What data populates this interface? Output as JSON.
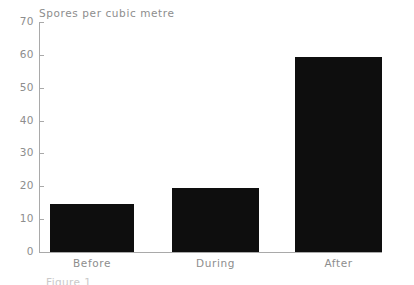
{
  "figure": {
    "axis_title": "Spores per cubic metre",
    "caption": "Figure 1",
    "background_color": "#ffffff",
    "axis_color": "#a9a9a9",
    "text_color": "#8d8d8d",
    "bar_color": "#0e0e0e"
  },
  "chart_data": {
    "type": "bar",
    "title": "",
    "subtitle": "",
    "xlabel": "",
    "ylabel": "Spores per cubic metre",
    "categories": [
      "Before",
      "During",
      "After"
    ],
    "values": [
      14.7,
      19.5,
      59.3
    ],
    "series": [
      {
        "name": "Spores per cubic metre",
        "values": [
          14.7,
          19.5,
          59.3
        ]
      }
    ],
    "ylim": [
      0,
      70
    ],
    "ytick_labels": [
      "0",
      "10",
      "20",
      "30",
      "40",
      "50",
      "60",
      "70"
    ],
    "yticks": [
      0,
      10,
      20,
      30,
      40,
      50,
      60,
      70
    ],
    "grid": false,
    "legend": false,
    "legend_position": "none",
    "annotations": []
  }
}
